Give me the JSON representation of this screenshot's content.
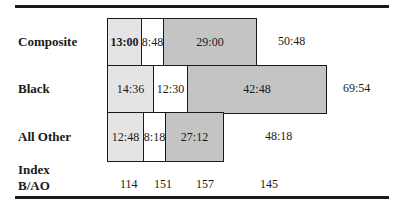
{
  "rows": [
    {
      "label": "Composite",
      "segments": [
        {
          "value": "13:00",
          "shade": "light",
          "bold": true
        },
        {
          "value": "8:48",
          "shade": "white"
        },
        {
          "value": "29:00",
          "shade": "dark"
        }
      ],
      "total": "50:48"
    },
    {
      "label": "Black",
      "segments": [
        {
          "value": "14:36",
          "shade": "light"
        },
        {
          "value": "12:30",
          "shade": "white"
        },
        {
          "value": "42:48",
          "shade": "dark"
        }
      ],
      "total": "69:54"
    },
    {
      "label": "All Other",
      "segments": [
        {
          "value": "12:48",
          "shade": "light"
        },
        {
          "value": "8:18",
          "shade": "white"
        },
        {
          "value": "27:12",
          "shade": "dark"
        }
      ],
      "total": "48:18"
    }
  ],
  "index": {
    "label_line1": "Index",
    "label_line2": "B/AO",
    "values": [
      "114",
      "151",
      "157",
      "145"
    ]
  },
  "colors": {
    "rule": "#1a1a1a",
    "light_fill": "#e4e4e4",
    "dark_fill": "#c4c4c4",
    "white_fill": "#ffffff"
  }
}
